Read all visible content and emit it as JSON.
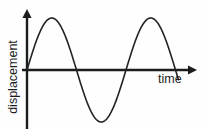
{
  "figure": {
    "background_color": "#fefefe",
    "stroke_color": "#1c1c1c",
    "text_color": "#1c1c1c",
    "width": 207,
    "height": 129
  },
  "axes": {
    "y_label": "displacement",
    "x_label": "time",
    "y_axis_x": 27,
    "x_axis_y": 70,
    "y_arrow_tip_y": 9,
    "x_arrow_tip_x": 197,
    "y_axis_bottom": 129,
    "x_axis_left": 22
  },
  "chart_data": {
    "type": "line",
    "title": "",
    "xlabel": "time",
    "ylabel": "displacement",
    "grid": false,
    "legend": null,
    "waveform": "sine",
    "amplitude_px": 52,
    "period_px": 99,
    "cycles_shown": 1.53,
    "phase": "starts at origin rising",
    "origin_px": [
      27,
      70
    ],
    "key_points_px": [
      [
        27,
        70
      ],
      [
        50,
        18
      ],
      [
        72,
        70
      ],
      [
        98,
        122
      ],
      [
        126,
        70
      ],
      [
        155,
        18
      ],
      [
        178,
        70
      ]
    ],
    "annotations": [
      "crest 1 at t=0.25T",
      "trough at t=0.75T",
      "crest 2 at t=1.25T"
    ],
    "x": [
      0,
      0.25,
      0.5,
      0.75,
      1.0,
      1.25,
      1.53
    ],
    "y": [
      0,
      1,
      0,
      -1,
      0,
      1,
      0
    ],
    "xlim": [
      0,
      1.72
    ],
    "ylim": [
      -1.13,
      1.18
    ]
  },
  "icons": {
    "y_arrow": "arrow-up-icon",
    "x_arrow": "arrow-right-icon"
  }
}
